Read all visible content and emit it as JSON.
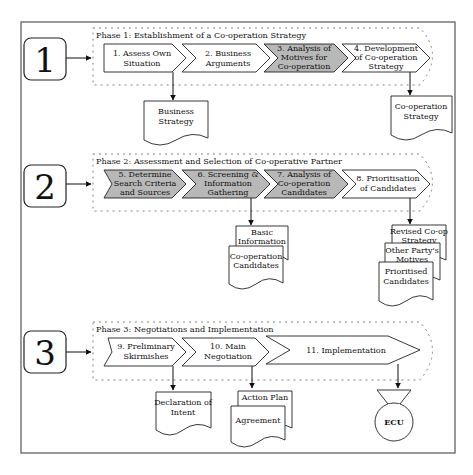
{
  "colors": {
    "shaded": "#b8b8b8",
    "white": "#ffffff",
    "stroke": "#222222",
    "frame": "#555555",
    "dots": "#777777"
  },
  "phases": [
    {
      "number": "1",
      "title": "Phase 1: Establishment of a Co-operation Strategy",
      "steps": [
        {
          "lines": [
            "1. Assess Own",
            "Situation"
          ],
          "shaded": false
        },
        {
          "lines": [
            "2. Business",
            "Arguments"
          ],
          "shaded": false
        },
        {
          "lines": [
            "3. Analysis of",
            "Motives for",
            "Co-operation"
          ],
          "shaded": true
        },
        {
          "lines": [
            "4. Development",
            "of Co-operation",
            "Strategy"
          ],
          "shaded": false
        }
      ],
      "outputs": [
        {
          "lines": [
            "Business",
            "Strategy"
          ]
        },
        {
          "lines": [
            "Co-operation",
            "Strategy"
          ]
        }
      ]
    },
    {
      "number": "2",
      "title": "Phase 2: Assessment and Selection of Co-operative Partner",
      "steps": [
        {
          "lines": [
            "5. Determine",
            "Search Criteria",
            "and Sources"
          ],
          "shaded": true
        },
        {
          "lines": [
            "6. Screening &",
            "Information",
            "Gathering"
          ],
          "shaded": true
        },
        {
          "lines": [
            "7. Analysis of",
            "Co-operation",
            "Candidates"
          ],
          "shaded": true
        },
        {
          "lines": [
            "8. Prioritisation",
            "of Candidates"
          ],
          "shaded": false
        }
      ],
      "outputs": [
        {
          "lines": [
            "Basic",
            "Information"
          ]
        },
        {
          "lines": [
            "Co-operation",
            "Candidates"
          ]
        },
        {
          "lines": [
            "Revised Co-op",
            "Strategy"
          ]
        },
        {
          "lines": [
            "Other Party's",
            "Motives"
          ]
        },
        {
          "lines": [
            "Prioritised",
            "Candidates"
          ]
        }
      ]
    },
    {
      "number": "3",
      "title": "Phase 3: Negotiations and Implementation",
      "steps": [
        {
          "lines": [
            "9. Preliminary",
            "Skirmishes"
          ],
          "shaded": false
        },
        {
          "lines": [
            "10. Main",
            "Negotiation"
          ],
          "shaded": false
        },
        {
          "lines": [
            "11. Implementation"
          ],
          "shaded": false
        }
      ],
      "outputs": [
        {
          "lines": [
            "Declaration of",
            "Intent"
          ]
        },
        {
          "lines": [
            "Action Plan"
          ]
        },
        {
          "lines": [
            "Agreement"
          ]
        },
        {
          "lines": [
            "ECU"
          ]
        }
      ]
    }
  ]
}
